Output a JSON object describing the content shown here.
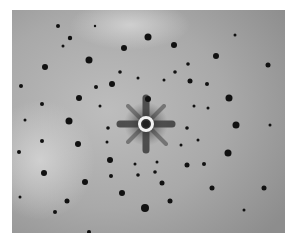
{
  "image": {
    "kind": "diffraction-pattern-photograph",
    "colors": {
      "background_page": "#ffffff",
      "film_light": "#c9c9c9",
      "film_mid": "#a8a8a8",
      "film_dark": "#8a8a8a",
      "spot": "#111111",
      "center_ring": "#f2f2f2"
    },
    "center": {
      "x": 146,
      "y": 124
    },
    "spots": [
      [
        148,
        37,
        3.5
      ],
      [
        124,
        48,
        3
      ],
      [
        174,
        45,
        3
      ],
      [
        89,
        60,
        3.5
      ],
      [
        216,
        56,
        3
      ],
      [
        70,
        38,
        2.2
      ],
      [
        58,
        26,
        2
      ],
      [
        45,
        67,
        3
      ],
      [
        268,
        65,
        2.5
      ],
      [
        112,
        84,
        3
      ],
      [
        96,
        87,
        2
      ],
      [
        190,
        81,
        2.5
      ],
      [
        207,
        84,
        2
      ],
      [
        79,
        98,
        3
      ],
      [
        229,
        98,
        3.5
      ],
      [
        42,
        104,
        2
      ],
      [
        21,
        86,
        2
      ],
      [
        148,
        99,
        3
      ],
      [
        69,
        121,
        3.5
      ],
      [
        236,
        125,
        3.5
      ],
      [
        108,
        128,
        1.8
      ],
      [
        187,
        128,
        1.8
      ],
      [
        78,
        144,
        3
      ],
      [
        228,
        153,
        3.5
      ],
      [
        42,
        141,
        2
      ],
      [
        19,
        152,
        2
      ],
      [
        110,
        160,
        3
      ],
      [
        204,
        164,
        2
      ],
      [
        187,
        165,
        2.5
      ],
      [
        44,
        173,
        3
      ],
      [
        85,
        182,
        3
      ],
      [
        162,
        183,
        2.5
      ],
      [
        122,
        193,
        3
      ],
      [
        212,
        188,
        2.5
      ],
      [
        67,
        201,
        2.5
      ],
      [
        145,
        208,
        4
      ],
      [
        170,
        201,
        2.5
      ],
      [
        55,
        212,
        2
      ],
      [
        264,
        188,
        2.5
      ],
      [
        89,
        232,
        2
      ],
      [
        111,
        176,
        2
      ],
      [
        138,
        175,
        1.8
      ],
      [
        155,
        172,
        1.8
      ],
      [
        138,
        78,
        1.5
      ],
      [
        120,
        72,
        1.8
      ],
      [
        175,
        72,
        1.8
      ],
      [
        188,
        64,
        1.8
      ],
      [
        164,
        80,
        1.5
      ],
      [
        100,
        106,
        1.5
      ],
      [
        194,
        106,
        1.5
      ],
      [
        208,
        108,
        1.5
      ],
      [
        198,
        140,
        1.5
      ],
      [
        107,
        142,
        1.5
      ],
      [
        181,
        145,
        1.5
      ],
      [
        135,
        164,
        1.5
      ],
      [
        157,
        162,
        1.5
      ],
      [
        25,
        120,
        1.5
      ],
      [
        270,
        125,
        1.5
      ],
      [
        235,
        35,
        1.5
      ],
      [
        20,
        197,
        1.5
      ],
      [
        244,
        210,
        1.5
      ],
      [
        63,
        46,
        1.5
      ],
      [
        95,
        26,
        1.2
      ]
    ]
  }
}
